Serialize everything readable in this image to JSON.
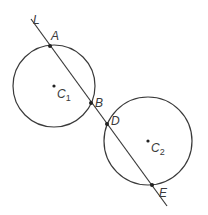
{
  "diagram": {
    "type": "two circles intersected by a line",
    "stroke_color": "#3a3a3a",
    "line": {
      "label": "L",
      "start": [
        31,
        19
      ],
      "end": [
        167,
        206
      ]
    },
    "circles": [
      {
        "name": "C",
        "subscript": "1",
        "center": [
          54,
          86
        ],
        "radius": 41
      },
      {
        "name": "C",
        "subscript": "2",
        "center": [
          148,
          141
        ],
        "radius": 44
      }
    ],
    "points": [
      {
        "label": "A",
        "position": [
          50,
          46
        ]
      },
      {
        "label": "B",
        "position": [
          91,
          103
        ]
      },
      {
        "label": "D",
        "position": [
          107,
          124
        ]
      },
      {
        "label": "E",
        "position": [
          152,
          185
        ]
      }
    ]
  }
}
